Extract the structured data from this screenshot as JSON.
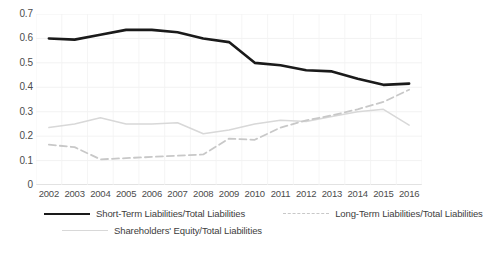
{
  "chart_data": {
    "type": "line",
    "title": "",
    "xlabel": "",
    "ylabel": "",
    "categories": [
      "2002",
      "2003",
      "2004",
      "2005",
      "2006",
      "2007",
      "2008",
      "2009",
      "2010",
      "2011",
      "2012",
      "2013",
      "2014",
      "2015",
      "2016"
    ],
    "ylim": [
      0,
      0.7
    ],
    "yticks": [
      "0",
      "0.1",
      "0.2",
      "0.3",
      "0.4",
      "0.5",
      "0.6",
      "0.7"
    ],
    "ytick_values": [
      0,
      0.1,
      0.2,
      0.3,
      0.4,
      0.5,
      0.6,
      0.7
    ],
    "grid": true,
    "legend_position": "bottom",
    "series": [
      {
        "name": "Short-Term Liabilities/Total Liabilities",
        "style": "solid",
        "color": "#1a1a1a",
        "values": [
          0.6,
          0.595,
          0.615,
          0.635,
          0.635,
          0.625,
          0.6,
          0.585,
          0.5,
          0.49,
          0.47,
          0.465,
          0.435,
          0.41,
          0.415
        ]
      },
      {
        "name": "Long-Term Liabilities/Total Liabilities",
        "style": "dashed",
        "color": "#c8c8c8",
        "values": [
          0.165,
          0.155,
          0.105,
          0.11,
          0.115,
          0.12,
          0.125,
          0.19,
          0.185,
          0.235,
          0.265,
          0.285,
          0.31,
          0.34,
          0.39
        ]
      },
      {
        "name": "Shareholders' Equity/Total Liabilities",
        "style": "solid-light",
        "color": "#d8d8d8",
        "values": [
          0.235,
          0.25,
          0.275,
          0.25,
          0.25,
          0.255,
          0.21,
          0.225,
          0.25,
          0.265,
          0.26,
          0.28,
          0.3,
          0.31,
          0.245
        ]
      }
    ]
  },
  "legend": {
    "items": [
      {
        "label": "Short-Term Liabilities/Total Liabilities",
        "swatch": "line-solid-swatch"
      },
      {
        "label": "Long-Term Liabilities/Total Liabilities",
        "swatch": "line-dashed-swatch"
      },
      {
        "label": "Shareholders' Equity/Total Liabilities",
        "swatch": "line-light-swatch"
      }
    ]
  }
}
